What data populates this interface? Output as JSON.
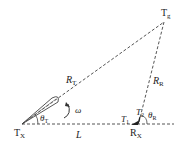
{
  "diagram": {
    "nodes": {
      "transmitter": {
        "label": "T",
        "sub": "X"
      },
      "receiver": {
        "label": "R",
        "sub": "X"
      },
      "target": {
        "label": "T",
        "sub": "g"
      }
    },
    "edges": {
      "tx_to_target": {
        "label": "R",
        "sub": "T"
      },
      "target_to_rx": {
        "label": "R",
        "sub": "R"
      },
      "baseline": {
        "label": "L"
      }
    },
    "angles": {
      "theta_t": {
        "label": "θ",
        "sub": "T"
      },
      "theta_r": {
        "label": "θ",
        "sub": "R"
      },
      "omega": {
        "label": "ω"
      }
    },
    "markers": {
      "t1": {
        "label": "T",
        "sub": "1"
      },
      "t2": {
        "label": "T",
        "sub": "2"
      }
    },
    "colors": {
      "line": "#444444",
      "text": "#222222"
    }
  }
}
